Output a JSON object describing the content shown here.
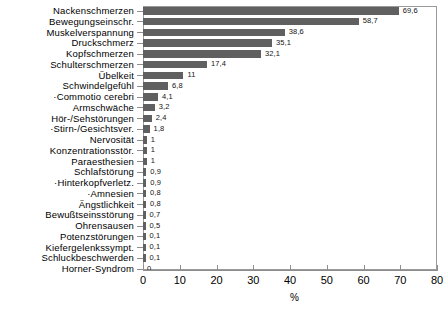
{
  "chart_data": {
    "type": "bar",
    "orientation": "horizontal",
    "title": "",
    "subtitle": "",
    "xlabel": "%",
    "ylabel": "",
    "xlim": [
      0,
      80
    ],
    "xticks": [
      0,
      10,
      20,
      30,
      40,
      50,
      60,
      70,
      80
    ],
    "xtick_labels": [
      "0",
      "10",
      "20",
      "30",
      "40",
      "50",
      "60",
      "70",
      "80"
    ],
    "grid": false,
    "legend": null,
    "bar_color": "#606060",
    "frame_color": "#9a9a9a",
    "categories": [
      "Nackenschmerzen",
      "Bewegungseinschr.",
      "Muskelverspannung",
      "Druckschmerz",
      "Kopfschmerzen",
      "Schulterschmerzen",
      "Übelkeit",
      "Schwindelgefühl",
      "·Commotio cerebri",
      "Armschwäche",
      "Hör-/Sehstörungen",
      "·Stirn-/Gesichtsver.",
      "Nervosität",
      "Konzentrationsstör.",
      "Paraesthesien",
      "Schlafstörung",
      "·Hinterkopfverletz.",
      "·Amnesien",
      "Ängstlichkeit",
      "Bewußtseinsstörung",
      "Ohrensausen",
      "Potenzstörungen",
      "Kiefergelenkssympt.",
      "Schluckbeschwerden",
      "Horner-Syndrom"
    ],
    "values": [
      69.6,
      58.7,
      38.6,
      35.1,
      32.1,
      17.4,
      11,
      6.8,
      4.1,
      3.2,
      2.4,
      1.8,
      1,
      1,
      1,
      0.9,
      0.9,
      0.8,
      0.8,
      0.7,
      0.5,
      0.1,
      0.1,
      0.1,
      0
    ],
    "value_labels": [
      "69,6",
      "58,7",
      "38,6",
      "35,1",
      "32,1",
      "17,4",
      "11",
      "6,8",
      "4,1",
      "3,2",
      "2,4",
      "1,8",
      "1",
      "1",
      "1",
      "0,9",
      "0,9",
      "0,8",
      "0,8",
      "0,7",
      "0,5",
      "0,1",
      "0,1",
      "0,1",
      "0"
    ]
  }
}
